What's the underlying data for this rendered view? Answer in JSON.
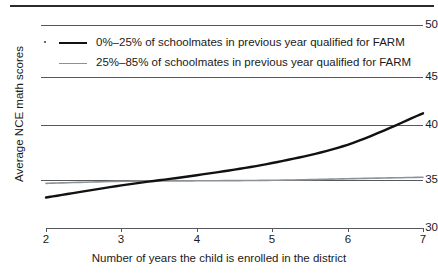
{
  "chart_data": {
    "type": "line",
    "title": "",
    "subtitle": "",
    "xlabel": "Number of years the child is enrolled in the district",
    "ylabel": "Average NCE math scores",
    "xlim": [
      2,
      7
    ],
    "ylim": [
      30,
      50
    ],
    "xticks": [
      2,
      3,
      4,
      5,
      6,
      7
    ],
    "yticks": [
      30,
      35,
      40,
      45,
      50
    ],
    "xtick_labels": [
      "2",
      "3",
      "4",
      "5",
      "6",
      "7"
    ],
    "ytick_labels": [
      "30",
      "35",
      "40",
      "45",
      "50"
    ],
    "grid": true,
    "grid_axis": "y",
    "legend_position": "upper-left-inside",
    "x": [
      2,
      3,
      4,
      5,
      6,
      7
    ],
    "series": [
      {
        "name": "0%-25% of schoolmates in previous year qualified for FARM",
        "label": "0%–25% of schoolmates in previous year qualified for FARM",
        "color": "#111111",
        "linewidth": 2.4,
        "values": [
          33.0,
          34.2,
          35.2,
          36.4,
          38.2,
          41.3
        ]
      },
      {
        "name": "25%-85% of schoolmates in previous year qualified for FARM",
        "label": "25%–85% of schoolmates in previous year qualified for FARM",
        "color": "#8d9296",
        "linewidth": 1.6,
        "values": [
          34.4,
          34.6,
          34.65,
          34.7,
          34.85,
          35.0
        ]
      }
    ]
  },
  "axes": {
    "y_title": "Average NCE math scores",
    "x_title": "Number of years the child is enrolled in the district",
    "y_values": [
      "50",
      "45",
      "40",
      "35",
      "30"
    ],
    "x_values": [
      "2",
      "3",
      "4",
      "5",
      "6",
      "7"
    ]
  },
  "legend": {
    "items": [
      {
        "label": "0%–25% of schoolmates in previous year qualified for FARM",
        "color": "#111111",
        "style": "solid-dark"
      },
      {
        "label": "25%–85% of schoolmates in previous year qualified for FARM",
        "color": "#8d9296",
        "style": "solid-light"
      }
    ]
  },
  "colors": {
    "series_dark": "#111111",
    "series_light": "#8d9296",
    "grid": "#55585c",
    "rule": "#2b2b2b",
    "text": "#1a1a1a",
    "background": "#ffffff"
  }
}
